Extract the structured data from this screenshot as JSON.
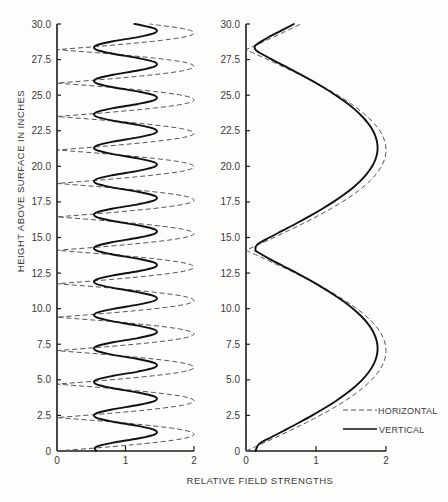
{
  "chart_data": [
    {
      "type": "line",
      "panel": "left",
      "title": "",
      "xlabel": "RELATIVE FIELD STRENGTHS",
      "ylabel": "HEIGHT ABOVE SURFACE IN INCHES",
      "xlim": [
        0,
        2
      ],
      "ylim": [
        0,
        30
      ],
      "xticks": [
        "0",
        "1",
        "2"
      ],
      "yticks": [
        "0",
        "2.5",
        "5.0",
        "7.5",
        "10.0",
        "12.5",
        "15.0",
        "17.5",
        "20.0",
        "22.5",
        "25.0",
        "27.5",
        "30.0"
      ],
      "grid": false,
      "orientation": "field strength on x-axis, height on y-axis",
      "y": [
        0,
        0.294,
        0.588,
        0.881,
        1.175,
        1.469,
        1.763,
        2.056,
        2.35,
        2.644,
        2.938,
        3.231,
        3.525,
        3.819,
        4.113,
        4.406,
        4.7,
        4.994,
        5.288,
        5.581,
        5.875,
        6.169,
        6.463,
        6.756,
        7.05,
        7.344,
        7.638,
        7.931,
        8.225,
        8.519,
        8.813,
        9.106,
        9.4,
        9.694,
        9.988,
        10.281,
        10.575,
        10.869,
        11.163,
        11.456,
        11.75,
        12.044,
        12.338,
        12.631,
        12.925,
        13.219,
        13.513,
        13.806,
        14.1,
        14.394,
        14.688,
        14.981,
        15.275,
        15.569,
        15.863,
        16.156,
        16.45,
        16.744,
        17.038,
        17.331,
        17.625,
        17.919,
        18.213,
        18.506,
        18.8,
        19.094,
        19.388,
        19.681,
        19.975,
        20.269,
        20.563,
        20.856,
        21.15,
        21.444,
        21.738,
        22.031,
        22.325,
        22.619,
        22.913,
        23.206,
        23.5,
        23.794,
        24.088,
        24.381,
        24.675,
        24.969,
        25.263,
        25.556,
        25.85,
        26.144,
        26.438,
        26.731,
        27.025,
        27.319,
        27.613,
        27.906,
        28.2,
        28.494,
        28.788,
        29.081,
        29.375,
        29.669,
        29.963,
        30
      ],
      "series": [
        {
          "name": "HORIZONTAL",
          "style": "dashed",
          "values": [
            0,
            0.77,
            1.41,
            1.85,
            2,
            1.85,
            1.41,
            0.77,
            0,
            0.77,
            1.41,
            1.85,
            2,
            1.85,
            1.41,
            0.77,
            0,
            0.77,
            1.41,
            1.85,
            2,
            1.85,
            1.41,
            0.77,
            0,
            0.77,
            1.41,
            1.85,
            2,
            1.85,
            1.41,
            0.77,
            0,
            0.77,
            1.41,
            1.85,
            2,
            1.85,
            1.41,
            0.77,
            0,
            0.77,
            1.41,
            1.85,
            2,
            1.85,
            1.41,
            0.77,
            0,
            0.77,
            1.41,
            1.85,
            2,
            1.85,
            1.41,
            0.77,
            0,
            0.77,
            1.41,
            1.85,
            2,
            1.85,
            1.41,
            0.77,
            0,
            0.77,
            1.41,
            1.85,
            2,
            1.85,
            1.41,
            0.77,
            0,
            0.77,
            1.41,
            1.85,
            2,
            1.85,
            1.41,
            0.77,
            0,
            0.77,
            1.41,
            1.85,
            2,
            1.85,
            1.41,
            0.77,
            0,
            0.77,
            1.41,
            1.85,
            2,
            1.85,
            1.41,
            0.77,
            0,
            0.77,
            1.41,
            1.85,
            2,
            1.85,
            1.41,
            1.35
          ]
        },
        {
          "name": "VERTICAL",
          "style": "solid",
          "values": [
            0.57,
            0.57,
            0.82,
            1.18,
            1.43,
            1.43,
            1.18,
            0.82,
            0.57,
            0.57,
            0.82,
            1.18,
            1.43,
            1.43,
            1.18,
            0.82,
            0.57,
            0.57,
            0.82,
            1.18,
            1.43,
            1.43,
            1.18,
            0.82,
            0.57,
            0.57,
            0.82,
            1.18,
            1.43,
            1.43,
            1.18,
            0.82,
            0.57,
            0.57,
            0.82,
            1.18,
            1.43,
            1.43,
            1.18,
            0.82,
            0.57,
            0.57,
            0.82,
            1.18,
            1.43,
            1.43,
            1.18,
            0.82,
            0.57,
            0.57,
            0.82,
            1.18,
            1.43,
            1.43,
            1.18,
            0.82,
            0.57,
            0.57,
            0.82,
            1.18,
            1.43,
            1.43,
            1.18,
            0.82,
            0.57,
            0.57,
            0.82,
            1.18,
            1.43,
            1.43,
            1.18,
            0.82,
            0.57,
            0.57,
            0.82,
            1.18,
            1.43,
            1.43,
            1.18,
            0.82,
            0.57,
            0.57,
            0.82,
            1.18,
            1.43,
            1.43,
            1.18,
            0.82,
            0.57,
            0.57,
            0.82,
            1.18,
            1.43,
            1.43,
            1.18,
            0.82,
            0.57,
            0.57,
            0.82,
            1.18,
            1.43,
            1.43,
            1.18,
            1.13
          ]
        }
      ]
    },
    {
      "type": "line",
      "panel": "right",
      "title": "",
      "xlabel": "RELATIVE FIELD STRENGTHS",
      "ylabel": "HEIGHT ABOVE SURFACE IN INCHES",
      "xlim": [
        0,
        2
      ],
      "ylim": [
        0,
        30
      ],
      "xticks": [
        "0",
        "1",
        "2"
      ],
      "yticks": [
        "0",
        "2.5",
        "5.0",
        "7.5",
        "10.0",
        "12.5",
        "15.0",
        "17.5",
        "20.0",
        "22.5",
        "25.0",
        "27.5",
        "30.0"
      ],
      "grid": false,
      "orientation": "field strength on x-axis, height on y-axis",
      "legend": {
        "position": "lower right",
        "entries": [
          {
            "label": "HORIZONTAL",
            "style": "dashed"
          },
          {
            "label": "VERTICAL",
            "style": "solid"
          }
        ]
      },
      "y": [
        0,
        0.5,
        1,
        1.5,
        2,
        2.5,
        3,
        3.5,
        4,
        4.5,
        5,
        5.5,
        6,
        6.5,
        7,
        7.5,
        8,
        8.5,
        9,
        9.5,
        10,
        10.5,
        11,
        11.5,
        12,
        12.5,
        13,
        13.5,
        14,
        14.1,
        14.5,
        15,
        15.5,
        16,
        16.5,
        17,
        17.5,
        18,
        18.5,
        19,
        19.5,
        20,
        20.5,
        21,
        21.5,
        22,
        22.5,
        23,
        23.5,
        24,
        24.5,
        25,
        25.5,
        26,
        26.5,
        27,
        27.5,
        28,
        28.2,
        28.5,
        29,
        29.5,
        30
      ],
      "series": [
        {
          "name": "HORIZONTAL",
          "style": "dashed",
          "values": [
            0,
            0.222,
            0.442,
            0.656,
            0.862,
            1.057,
            1.24,
            1.406,
            1.556,
            1.686,
            1.795,
            1.882,
            1.945,
            1.985,
            2.0,
            1.99,
            1.956,
            1.897,
            1.814,
            1.709,
            1.583,
            1.437,
            1.275,
            1.097,
            0.906,
            0.706,
            0.485,
            0.267,
            0.045,
            0,
            0.178,
            0.399,
            0.614,
            0.822,
            1.019,
            1.204,
            1.375,
            1.528,
            1.661,
            1.775,
            1.866,
            1.935,
            1.979,
            1.999,
            1.994,
            1.964,
            1.911,
            1.833,
            1.732,
            1.61,
            1.469,
            1.309,
            1.133,
            0.944,
            0.745,
            0.528,
            0.311,
            0.089,
            0,
            0.134,
            0.355,
            0.571,
            0.781
          ]
        },
        {
          "name": "VERTICAL",
          "style": "solid",
          "values": [
            0.135,
            0.189,
            0.373,
            0.569,
            0.761,
            0.946,
            1.119,
            1.28,
            1.424,
            1.552,
            1.659,
            1.747,
            1.813,
            1.857,
            1.878,
            1.876,
            1.85,
            1.802,
            1.732,
            1.64,
            1.528,
            1.397,
            1.249,
            1.087,
            0.911,
            0.726,
            0.53,
            0.334,
            0.159,
            0.135,
            0.159,
            0.334,
            0.529,
            0.723,
            0.909,
            1.085,
            1.248,
            1.396,
            1.527,
            1.639,
            1.731,
            1.802,
            1.85,
            1.876,
            1.878,
            1.857,
            1.814,
            1.748,
            1.66,
            1.553,
            1.426,
            1.281,
            1.121,
            0.947,
            0.763,
            0.569,
            0.373,
            0.189,
            0.135,
            0.135,
            0.296,
            0.49,
            0.684
          ]
        }
      ]
    }
  ],
  "colors": {
    "solid_curve": "#111111",
    "dashed_curve": "#555555",
    "axis": "#1a1a1a",
    "text": "#3a3a3a"
  }
}
